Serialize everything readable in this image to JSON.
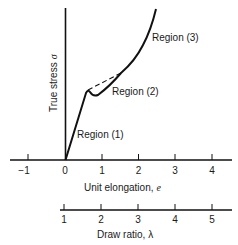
{
  "diagram": {
    "y_axis_label": "True stress",
    "y_axis_symbol": "σ",
    "x_axis_label": "Unit elongation,",
    "x_axis_symbol": "e",
    "x_ticks": [
      "−1",
      "0",
      "1",
      "2",
      "3",
      "4"
    ],
    "second_axis_label": "Draw ratio,",
    "second_axis_symbol": "λ",
    "second_axis_ticks": [
      "1",
      "2",
      "3",
      "4",
      "5"
    ],
    "regions": [
      {
        "label": "Region (1)"
      },
      {
        "label": "Region (2)"
      },
      {
        "label": "Region (3)"
      }
    ],
    "colors": {
      "line": "#111111",
      "text": "#1a1a1a",
      "background": "#ffffff"
    }
  }
}
